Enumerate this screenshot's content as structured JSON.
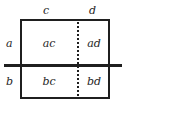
{
  "diagram": {
    "type": "two-by-two-partition-rectangle",
    "column_headers": [
      {
        "key": "c",
        "label": "c"
      },
      {
        "key": "d",
        "label": "d"
      }
    ],
    "row_headers": [
      {
        "key": "a",
        "label": "a"
      },
      {
        "key": "b",
        "label": "b"
      }
    ],
    "cells": [
      {
        "key": "ac",
        "label": "ac",
        "row": "a",
        "column": "c"
      },
      {
        "key": "ad",
        "label": "ad",
        "row": "a",
        "column": "d"
      },
      {
        "key": "bc",
        "label": "bc",
        "row": "b",
        "column": "c"
      },
      {
        "key": "bd",
        "label": "bd",
        "row": "b",
        "column": "d"
      }
    ],
    "dividers": {
      "vertical_style": "dotted",
      "horizontal_style": "solid"
    },
    "colors": {
      "ink": "#1f1f1f",
      "background": "#ffffff"
    }
  }
}
